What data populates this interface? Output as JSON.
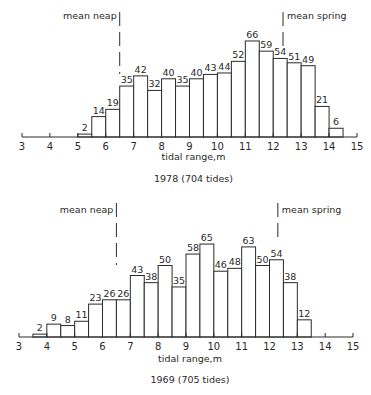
{
  "chart_data": [
    {
      "type": "bar",
      "title": "1978  (704 tides)",
      "xlabel": "tidal range,m",
      "ylabel": "",
      "xlim": [
        3,
        15
      ],
      "x_ticks": [
        3,
        4,
        5,
        6,
        7,
        8,
        9,
        10,
        11,
        12,
        13,
        14,
        15
      ],
      "bin_width": 0.5,
      "bins": [
        5.0,
        5.5,
        6.0,
        6.5,
        7.0,
        7.5,
        8.0,
        8.5,
        9.0,
        9.5,
        10.0,
        10.5,
        11.0,
        11.5,
        12.0,
        12.5,
        13.0,
        13.5,
        14.0
      ],
      "values": [
        2,
        14,
        19,
        35,
        42,
        32,
        40,
        35,
        40,
        43,
        44,
        52,
        66,
        59,
        54,
        51,
        49,
        21,
        6
      ],
      "annotations": [
        {
          "text": "mean neap",
          "x": 6.5
        },
        {
          "text": "mean spring",
          "x": 12.35
        }
      ],
      "grid": false
    },
    {
      "type": "bar",
      "title": "1969  (705 tides)",
      "xlabel": "tidal range,m",
      "ylabel": "",
      "xlim": [
        3,
        15
      ],
      "x_ticks": [
        3,
        4,
        5,
        6,
        7,
        8,
        9,
        10,
        11,
        12,
        13,
        14,
        15
      ],
      "bin_width": 0.5,
      "bins": [
        3.5,
        4.0,
        4.5,
        5.0,
        5.5,
        6.0,
        6.5,
        7.0,
        7.5,
        8.0,
        8.5,
        9.0,
        9.5,
        10.0,
        10.5,
        11.0,
        11.5,
        12.0,
        12.5,
        13.0
      ],
      "values": [
        2,
        9,
        8,
        11,
        23,
        26,
        26,
        43,
        38,
        50,
        35,
        58,
        65,
        46,
        48,
        63,
        50,
        54,
        38,
        12
      ],
      "annotations": [
        {
          "text": "mean neap",
          "x": 6.5
        },
        {
          "text": "mean spring",
          "x": 12.3
        }
      ],
      "grid": false
    }
  ],
  "layout": [
    {
      "x0": 22,
      "x1": 357,
      "axis_y": 137,
      "px_per_unit": 1.455,
      "dash_top": 12,
      "label_y": 19,
      "xlabel_y": 160,
      "title_y": 182
    },
    {
      "x0": 19,
      "x1": 353,
      "axis_y": 337,
      "px_per_unit": 1.43,
      "dash_top": 203,
      "label_y": 213,
      "xlabel_y": 362,
      "title_y": 383
    }
  ]
}
